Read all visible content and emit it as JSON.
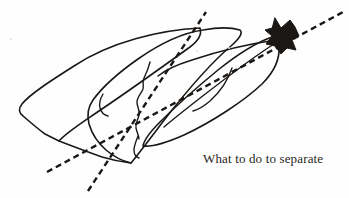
{
  "canvas": {
    "width": 349,
    "height": 198,
    "background_color": "#fefefe",
    "ink_color": "#1a1715",
    "description": "Hand-drawn ink sketch of three overlapping elongated leaf or petal shapes converging at a solid black arrowhead at the upper right, crossed by two long dashed guide lines."
  },
  "caption": {
    "text": "What to do to separate",
    "color": "#2a2724",
    "font_size_px": 13,
    "x": 203,
    "y": 151
  },
  "figure": {
    "title": "What to do to separate",
    "type": "hand-drawn-diagram",
    "ink_color": "#1a1715",
    "stroke_width": 1.6,
    "elements": [
      {
        "name": "left-leaf-outline",
        "kind": "closed-outline",
        "description": "Large leftmost pointed leaf shape, tip toward upper right, blunt cut end at lower left",
        "path": "M 200 28 C 160 30 110 42 74 66 C 52 80 30 94 22 104 C 18 109 19 113 23 116 C 30 122 38 129 45 134 L 59 141 C 66 133 80 124 96 113 C 126 93 165 65 190 47 C 198 41 202 34 200 28 Z"
      },
      {
        "name": "middle-leaf-outline",
        "kind": "closed-outline",
        "description": "Central leaf shape overlapping the left leaf, tip at upper right near the arrowhead",
        "path": "M 203 30 C 182 33 158 45 138 59 C 118 73 101 89 93 100 C 88 107 87 116 89 124 C 92 134 98 143 106 150 C 113 156 122 161 131 163 C 140 152 152 136 165 119 C 186 92 212 62 231 46 C 240 38 243 33 240 30 C 230 27 214 28 203 30 Z"
      },
      {
        "name": "right-leaf-outline",
        "kind": "closed-outline",
        "description": "Rightmost lower leaf sweeping from the arrowhead down to the lower middle",
        "path": "M 272 37 C 258 42 238 54 218 70 C 196 88 174 108 160 122 C 150 132 144 140 143 146 C 152 147 166 143 184 135 C 212 122 244 101 262 84 C 274 72 280 58 279 46 C 278 40 276 37 272 37 Z"
      },
      {
        "name": "inner-vein-upper",
        "kind": "open-stroke",
        "description": "Long thin vein line running from the arrowhead tip back into the middle leaf",
        "path": "M 276 40 C 248 44 216 52 192 60 C 176 65 164 71 158 76"
      },
      {
        "name": "inner-vein-lower",
        "kind": "open-stroke",
        "description": "Second curved vein sweeping inside the right leaf",
        "path": "M 274 44 C 252 58 226 78 204 95 C 186 109 172 120 164 127"
      },
      {
        "name": "inner-vein-right-curl",
        "kind": "open-stroke",
        "description": "Small curl inside the right leaf near its midpoint",
        "path": "M 232 68 C 228 80 220 92 210 101 C 203 107 197 110 193 111"
      },
      {
        "name": "middle-jagged-stroke",
        "kind": "open-stroke",
        "description": "Irregular jagged vertical squiggle in the center where the leaves overlap",
        "path": "M 150 62 C 148 70 146 74 144 78 C 142 82 144 85 143 89 C 141 94 137 97 137 102 C 137 107 140 110 139 115 C 138 120 135 123 136 128 C 137 133 139 136 139 139"
      },
      {
        "name": "middle-lower-hook",
        "kind": "open-stroke",
        "description": "Short hooked stroke at the base of the jagged squiggle",
        "path": "M 138 136 C 136 141 134 146 134 150 C 134 154 136 157 139 158"
      },
      {
        "name": "left-leaf-notch",
        "kind": "open-stroke",
        "description": "Small notch stroke where the left leaf meets the middle leaf",
        "path": "M 103 94 C 100 99 99 104 100 108 C 101 112 104 115 108 116"
      },
      {
        "name": "left-base-stroke",
        "kind": "open-stroke",
        "description": "Lower cut edge of the left leaf base",
        "path": "M 59 141 C 72 146 88 152 102 157 C 112 160 122 162 131 163"
      },
      {
        "name": "arrowhead",
        "kind": "filled-shape",
        "description": "Solid black irregular arrowhead blob at the upper right where all leaves converge",
        "path": "M 275 18 L 281 28 L 290 20 L 295 27 L 299 36 L 292 40 L 296 50 L 287 48 L 281 54 L 275 46 L 266 44 L 272 36 L 265 30 L 272 28 Z"
      },
      {
        "name": "dashed-line-shallow",
        "kind": "dashed-line",
        "description": "Long shallow dashed guide line running from the lower left up to the upper right corner past the arrowhead",
        "x1": 47,
        "y1": 172,
        "x2": 345,
        "y2": 11,
        "dash": "6 4"
      },
      {
        "name": "dashed-line-steep",
        "kind": "dashed-line",
        "description": "Steeper dashed guide line running from the lower centre up to the top of the middle leaf",
        "x1": 88,
        "y1": 191,
        "x2": 206,
        "y2": 12,
        "dash": "6 4"
      }
    ]
  },
  "artifacts": [
    {
      "name": "paper-speck",
      "x": 10,
      "y": 38,
      "size": 2
    },
    {
      "name": "paper-speck",
      "x": 196,
      "y": 50,
      "size": 2
    },
    {
      "name": "paper-speck",
      "x": 228,
      "y": 47,
      "size": 2
    }
  ]
}
